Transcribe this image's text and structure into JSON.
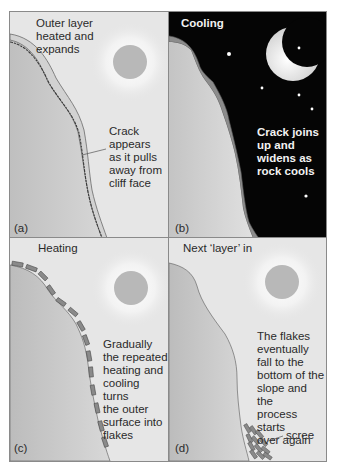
{
  "figure": {
    "panels": [
      {
        "id": "a",
        "label": "(a)",
        "caption": "Outer layer\nheated and\nexpands",
        "annotation": "Crack\nappears\nas it pulls\naway from\ncliff face",
        "sky": "day",
        "icon": "sun-icon"
      },
      {
        "id": "b",
        "label": "(b)",
        "caption": "Cooling",
        "annotation": "Crack joins\nup and\nwidens as\nrock cools",
        "sky": "night",
        "icon": "moon-icon"
      },
      {
        "id": "c",
        "label": "(c)",
        "caption": "Heating",
        "annotation": "Gradually\nthe repeated\nheating and\ncooling turns\nthe outer\nsurface into\nflakes",
        "sky": "day",
        "icon": "sun-icon"
      },
      {
        "id": "d",
        "label": "(d)",
        "caption": "Next ‘layer’ in",
        "annotation": "The flakes\neventually\nfall to the\nbottom of the\nslope and the\nprocess starts\nover again",
        "callout": "scree",
        "sky": "day",
        "icon": "sun-icon"
      }
    ]
  },
  "colors": {
    "day_sky": "#e6e6e6",
    "night_sky": "#050505",
    "rock": "#c8c8c8",
    "outer_layer": "#9a9a9a",
    "sun": "#b8b8b8",
    "moon": "#e8e8e8",
    "text": "#2a2a2a",
    "night_text": "#f2f2f2"
  }
}
